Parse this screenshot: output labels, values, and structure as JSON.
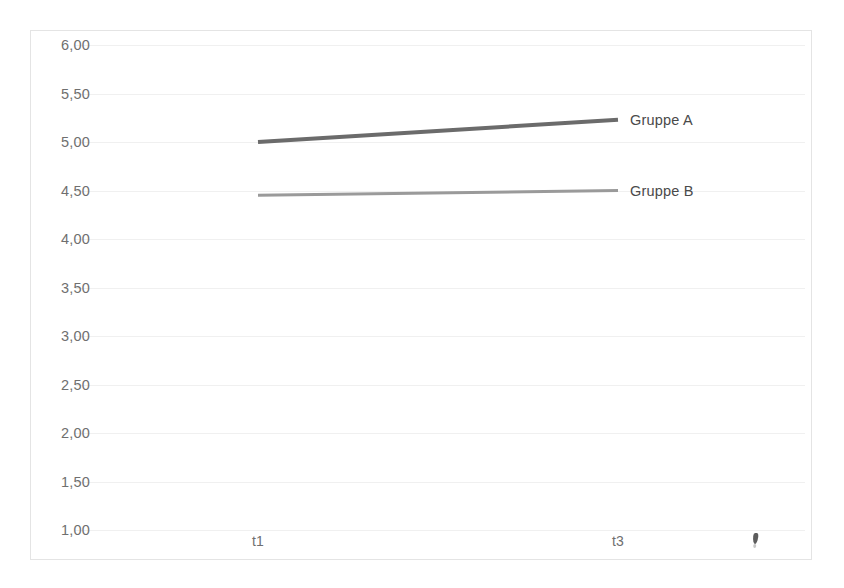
{
  "chart_data": {
    "type": "line",
    "title": "",
    "subtitle": "",
    "xlabel": "",
    "ylabel": "",
    "categories": [
      "t1",
      "t3"
    ],
    "x_tick_labels": [
      "t1",
      "t3"
    ],
    "y_tick_labels": [
      "6,00",
      "5,50",
      "5,00",
      "4,50",
      "4,00",
      "3,50",
      "3,00",
      "2,50",
      "2,00",
      "1,50",
      "1,00"
    ],
    "y_tick_values": [
      6.0,
      5.5,
      5.0,
      4.5,
      4.0,
      3.5,
      3.0,
      2.5,
      2.0,
      1.5,
      1.0
    ],
    "ylim": [
      1.0,
      6.0
    ],
    "y_tick_step": 0.5,
    "grid": true,
    "grid_axis": "y",
    "legend_position": "end-of-line",
    "decimal_separator": ",",
    "series": [
      {
        "name": "Gruppe A",
        "label": "Gruppe A",
        "values": [
          5.0,
          5.23
        ],
        "color": "#6b6b6b",
        "line_width": 4
      },
      {
        "name": "Gruppe B",
        "label": "Gruppe B",
        "values": [
          4.45,
          4.5
        ],
        "color": "#9a9a9a",
        "line_width": 3
      }
    ]
  },
  "artifacts": {
    "scan_mark_label": "scan-smudge"
  }
}
